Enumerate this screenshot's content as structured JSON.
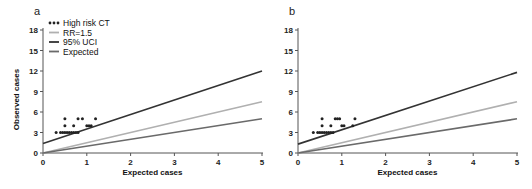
{
  "chart_data": [
    {
      "panel": "a",
      "type": "scatter",
      "title": "",
      "xlabel": "Expected cases",
      "ylabel": "Observed cases",
      "xlim": [
        0,
        5
      ],
      "ylim": [
        0,
        18
      ],
      "xticks": [
        0,
        1,
        2,
        3,
        4,
        5
      ],
      "yticks": [
        0,
        3,
        6,
        9,
        12,
        15,
        18
      ],
      "grid": false,
      "legend_position": "upper left",
      "legend": [
        "High risk CT",
        "RR=1.5",
        "95% UCI",
        "Expected"
      ],
      "series": [
        {
          "name": "High risk CT",
          "kind": "points",
          "color": "#222222",
          "points": [
            [
              0.3,
              3
            ],
            [
              0.4,
              3
            ],
            [
              0.45,
              3
            ],
            [
              0.5,
              3
            ],
            [
              0.55,
              3
            ],
            [
              0.6,
              3
            ],
            [
              0.65,
              3
            ],
            [
              0.7,
              3
            ],
            [
              0.75,
              3
            ],
            [
              0.8,
              3
            ],
            [
              0.5,
              4
            ],
            [
              0.7,
              4
            ],
            [
              1.0,
              4
            ],
            [
              1.05,
              4
            ],
            [
              1.1,
              4
            ],
            [
              0.5,
              5
            ],
            [
              0.8,
              5
            ],
            [
              0.9,
              5
            ],
            [
              1.2,
              5
            ]
          ]
        },
        {
          "name": "RR=1.5",
          "kind": "line",
          "color": "#b0b0b0",
          "x": [
            0,
            5
          ],
          "y": [
            0,
            7.5
          ]
        },
        {
          "name": "95% UCI",
          "kind": "line",
          "color": "#333333",
          "x": [
            0,
            5
          ],
          "y": [
            1.4,
            12
          ]
        },
        {
          "name": "Expected",
          "kind": "line",
          "color": "#6a6a6a",
          "x": [
            0,
            5
          ],
          "y": [
            0,
            5
          ]
        }
      ]
    },
    {
      "panel": "b",
      "type": "scatter",
      "title": "",
      "xlabel": "Expected cases",
      "ylabel": "",
      "xlim": [
        0,
        5
      ],
      "ylim": [
        0,
        18
      ],
      "xticks": [
        0,
        1,
        2,
        3,
        4,
        5
      ],
      "yticks": [
        0,
        3,
        6,
        9,
        12,
        15,
        18
      ],
      "grid": false,
      "series": [
        {
          "name": "High risk CT",
          "kind": "points",
          "color": "#222222",
          "points": [
            [
              0.35,
              3
            ],
            [
              0.45,
              3
            ],
            [
              0.5,
              3
            ],
            [
              0.55,
              3
            ],
            [
              0.6,
              3
            ],
            [
              0.65,
              3
            ],
            [
              0.7,
              3
            ],
            [
              0.75,
              3
            ],
            [
              0.8,
              3
            ],
            [
              0.55,
              4
            ],
            [
              0.75,
              4
            ],
            [
              1.0,
              4
            ],
            [
              1.05,
              4
            ],
            [
              1.25,
              4
            ],
            [
              0.55,
              5
            ],
            [
              0.85,
              5
            ],
            [
              0.9,
              5
            ],
            [
              0.95,
              5
            ],
            [
              1.3,
              5
            ]
          ]
        },
        {
          "name": "RR=1.5",
          "kind": "line",
          "color": "#b0b0b0",
          "x": [
            0,
            5
          ],
          "y": [
            0,
            7.5
          ]
        },
        {
          "name": "95% UCI",
          "kind": "line",
          "color": "#333333",
          "x": [
            0,
            5
          ],
          "y": [
            1.3,
            11.8
          ]
        },
        {
          "name": "Expected",
          "kind": "line",
          "color": "#6a6a6a",
          "x": [
            0,
            5
          ],
          "y": [
            0,
            5
          ]
        }
      ]
    }
  ],
  "labels": {
    "panel_a": "a",
    "panel_b": "b",
    "xlabel": "Expected cases",
    "ylabel": "Observed cases",
    "legend": [
      "High risk CT",
      "RR=1.5",
      "95% UCI",
      "Expected"
    ]
  }
}
